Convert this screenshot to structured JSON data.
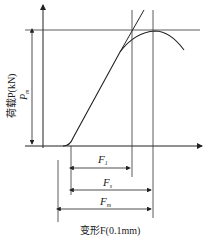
{
  "diagram": {
    "type": "load-deformation curve",
    "y_axis_label": "荷载P(kN)",
    "x_axis_label": "变形F(0.1mm)",
    "pm_label": "P",
    "pm_sub": "m",
    "dimensions": [
      {
        "name": "F",
        "sub": "1"
      },
      {
        "name": "F",
        "sub": "s"
      },
      {
        "name": "F",
        "sub": "m"
      }
    ],
    "colors": {
      "line": "#222222",
      "background": "#ffffff"
    }
  }
}
